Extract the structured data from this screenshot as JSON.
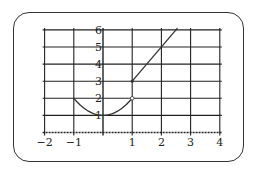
{
  "chart_data": {
    "type": "line",
    "title": "",
    "xlabel": "",
    "ylabel": "",
    "xlim": [
      -2,
      4
    ],
    "ylim": [
      0,
      6
    ],
    "grid": true,
    "x_ticks": [
      "−2",
      "−1",
      "1",
      "2",
      "3",
      "4"
    ],
    "y_ticks": [
      "1",
      "2",
      "3",
      "4",
      "5",
      "6"
    ],
    "series": [
      {
        "name": "piece-1 parabola",
        "formula": "y = x^2 + 1",
        "domain": [
          -1,
          1
        ],
        "points": [
          [
            -1,
            2
          ],
          [
            -0.5,
            1.25
          ],
          [
            0,
            1
          ],
          [
            0.5,
            1.25
          ],
          [
            1,
            2
          ]
        ],
        "endpoints": {
          "left": "closed",
          "right": "open"
        }
      },
      {
        "name": "piece-2 line",
        "formula": "y = 2x + 1",
        "domain": [
          1,
          2.6
        ],
        "points": [
          [
            1,
            3
          ],
          [
            2,
            5
          ],
          [
            2.5,
            6
          ]
        ],
        "endpoints": {
          "left": "closed"
        }
      }
    ]
  },
  "colors": {
    "line": "#333333",
    "grid": "#222222",
    "frame": "#333333"
  }
}
